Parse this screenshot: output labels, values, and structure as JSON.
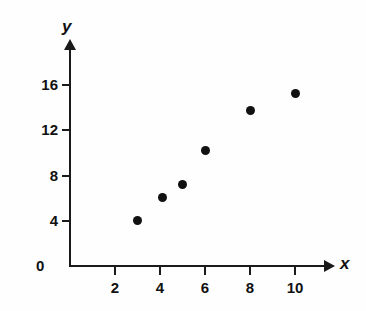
{
  "chart_data": {
    "type": "scatter",
    "title": "",
    "xlabel": "x",
    "ylabel": "y",
    "origin_label": "0",
    "x": [
      3,
      4.1,
      5,
      6,
      8,
      10
    ],
    "y": [
      4,
      6.1,
      7.2,
      10.2,
      13.8,
      15.3
    ],
    "points": [
      {
        "x": 3,
        "y": 4
      },
      {
        "x": 4.1,
        "y": 6.1
      },
      {
        "x": 5,
        "y": 7.2
      },
      {
        "x": 6,
        "y": 10.2
      },
      {
        "x": 8,
        "y": 13.8
      },
      {
        "x": 10,
        "y": 15.3
      }
    ],
    "xticks": [
      2,
      4,
      6,
      8,
      10
    ],
    "xtick_labels": [
      "2",
      "4",
      "6",
      "8",
      "10"
    ],
    "yticks": [
      4,
      8,
      12,
      16
    ],
    "ytick_labels": [
      "4",
      "8",
      "12",
      "16"
    ],
    "xlim": [
      0,
      11.5
    ],
    "ylim": [
      0,
      19.5
    ],
    "grid": false,
    "legend": null,
    "marker_color": "#111111",
    "axis_color": "#1a1a1a",
    "background_color": "#fefefe"
  }
}
